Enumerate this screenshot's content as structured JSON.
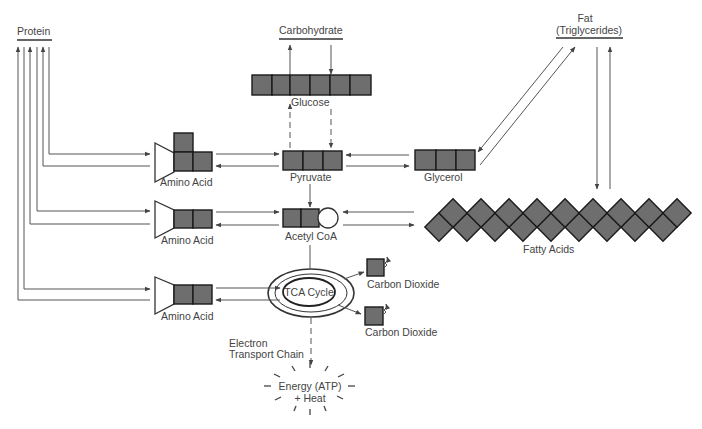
{
  "sources": {
    "protein": "Protein",
    "carbohydrate": "Carbohydrate",
    "fat_line1": "Fat",
    "fat_line2": "(Triglycerides)"
  },
  "intermediates": {
    "glucose": "Glucose",
    "pyruvate": "Pyruvate",
    "glycerol": "Glycerol",
    "acetyl_coa": "Acetyl CoA",
    "fatty_acids": "Fatty Acids",
    "tca_cycle": "TCA Cycle"
  },
  "amino_acids": [
    "Amino Acid",
    "Amino Acid",
    "Amino Acid"
  ],
  "products": {
    "co2_1": "Carbon Dioxide",
    "co2_2": "Carbon Dioxide",
    "etc_line1": "Electron",
    "etc_line2": "Transport Chain",
    "energy_line1": "Energy (ATP)",
    "energy_line2": "+ Heat"
  },
  "colors": {
    "box_fill": "#6e6e6e",
    "box_stroke": "#1a1a1a",
    "line": "#555555",
    "text": "#444444"
  }
}
